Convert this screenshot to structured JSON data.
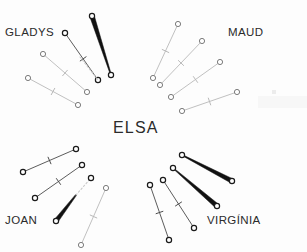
{
  "figure": {
    "type": "radial-segment-diagram",
    "background_color": "#fdfdfd",
    "width": 307,
    "height": 252
  },
  "labels": {
    "center": {
      "text": "ELSA",
      "x": 113,
      "y": 119
    },
    "top_left": {
      "text": "GLADYS",
      "x": 5,
      "y": 26
    },
    "top_right": {
      "text": "MAUD",
      "x": 228,
      "y": 26
    },
    "bottom_left": {
      "text": "JOAN",
      "x": 5,
      "y": 214
    },
    "bottom_right": {
      "text": "VIRGÍNIA",
      "x": 207,
      "y": 214
    }
  },
  "colors": {
    "thin_light": "#b9b9b9",
    "thin_dark": "#4a4a4a",
    "thick_black": "#111111",
    "dashed": "#c9c9c9",
    "marker_stroke": "#6d6d6d",
    "marker_stroke_dark": "#1a1a1a",
    "text": "#2b2b2b"
  },
  "groups": [
    {
      "name": "gladys-group",
      "label": "GLADYS",
      "segments": [
        {
          "id": "gladys-seg-1",
          "style": "thick-taper",
          "x1": 92,
          "y1": 16,
          "x2": 111,
          "y2": 75,
          "w1": 4.6,
          "w2": 0.9,
          "tick": false,
          "markers": [
            "start-dark",
            "end-dark"
          ]
        },
        {
          "id": "gladys-seg-2",
          "style": "thin-dark",
          "x1": 65,
          "y1": 33,
          "x2": 98,
          "y2": 80,
          "w1": 0.9,
          "w2": 0.9,
          "tick": true,
          "tick_pos": 0.55,
          "markers": [
            "start-dark",
            "end-dark"
          ]
        },
        {
          "id": "gladys-seg-3",
          "style": "dashed",
          "x1": 80,
          "y1": 57,
          "x2": 98,
          "y2": 80,
          "w1": 0.9,
          "w2": 0.9,
          "tick": false,
          "markers": []
        },
        {
          "id": "gladys-seg-4",
          "style": "thin-light",
          "x1": 43,
          "y1": 54,
          "x2": 87,
          "y2": 92,
          "w1": 0.9,
          "w2": 0.9,
          "tick": true,
          "tick_pos": 0.5,
          "markers": [
            "start-light",
            "end-light"
          ]
        },
        {
          "id": "gladys-seg-5",
          "style": "thin-light",
          "x1": 28,
          "y1": 78,
          "x2": 78,
          "y2": 105,
          "w1": 0.9,
          "w2": 0.9,
          "tick": true,
          "tick_pos": 0.5,
          "markers": [
            "start-light",
            "end-light"
          ]
        }
      ]
    },
    {
      "name": "maud-group",
      "label": "MAUD",
      "segments": [
        {
          "id": "maud-seg-1",
          "style": "thin-light",
          "x1": 153,
          "y1": 78,
          "x2": 178,
          "y2": 24,
          "w1": 0.9,
          "w2": 0.9,
          "tick": true,
          "tick_pos": 0.5,
          "markers": [
            "start-light",
            "end-light"
          ]
        },
        {
          "id": "maud-seg-2",
          "style": "thin-light",
          "x1": 160,
          "y1": 85,
          "x2": 202,
          "y2": 41,
          "w1": 0.9,
          "w2": 0.9,
          "tick": true,
          "tick_pos": 0.5,
          "markers": [
            "start-light",
            "end-light"
          ]
        },
        {
          "id": "maud-seg-3",
          "style": "thin-light",
          "x1": 171,
          "y1": 97,
          "x2": 220,
          "y2": 62,
          "w1": 0.9,
          "w2": 0.9,
          "tick": true,
          "tick_pos": 0.5,
          "markers": [
            "start-light",
            "end-light"
          ]
        },
        {
          "id": "maud-seg-4",
          "style": "thin-light",
          "x1": 182,
          "y1": 111,
          "x2": 237,
          "y2": 92,
          "w1": 0.9,
          "w2": 0.9,
          "tick": true,
          "tick_pos": 0.5,
          "markers": [
            "start-light",
            "end-light"
          ]
        }
      ]
    },
    {
      "name": "joan-group",
      "label": "JOAN",
      "segments": [
        {
          "id": "joan-seg-1",
          "style": "thin-dark",
          "x1": 23,
          "y1": 172,
          "x2": 76,
          "y2": 149,
          "w1": 0.9,
          "w2": 0.9,
          "tick": true,
          "tick_pos": 0.5,
          "markers": [
            "start-dark",
            "end-dark"
          ]
        },
        {
          "id": "joan-seg-2",
          "style": "thin-dark",
          "x1": 35,
          "y1": 198,
          "x2": 82,
          "y2": 165,
          "w1": 0.9,
          "w2": 0.9,
          "tick": true,
          "tick_pos": 0.5,
          "markers": [
            "start-dark",
            "end-dark"
          ]
        },
        {
          "id": "joan-seg-3",
          "style": "thick-taper",
          "x1": 56,
          "y1": 221,
          "x2": 76,
          "y2": 195,
          "w1": 4.4,
          "w2": 1.2,
          "tick": false,
          "markers": [
            "start-dark"
          ]
        },
        {
          "id": "joan-seg-4",
          "style": "dashed",
          "x1": 76,
          "y1": 195,
          "x2": 91,
          "y2": 178,
          "w1": 0.9,
          "w2": 0.9,
          "tick": false,
          "markers": [
            "end-dark"
          ]
        },
        {
          "id": "joan-seg-5",
          "style": "thin-light",
          "x1": 81,
          "y1": 245,
          "x2": 106,
          "y2": 188,
          "w1": 0.9,
          "w2": 0.9,
          "tick": true,
          "tick_pos": 0.5,
          "markers": [
            "start-light",
            "end-light"
          ]
        }
      ]
    },
    {
      "name": "virginia-group",
      "label": "VIRGÍNIA",
      "segments": [
        {
          "id": "virginia-seg-1",
          "style": "thick-taper",
          "x1": 182,
          "y1": 155,
          "x2": 232,
          "y2": 181,
          "w1": 0.9,
          "w2": 4.6,
          "tick": false,
          "markers": [
            "start-dark",
            "end-dark"
          ]
        },
        {
          "id": "virginia-seg-2",
          "style": "thick-taper",
          "x1": 173,
          "y1": 168,
          "x2": 217,
          "y2": 206,
          "w1": 0.9,
          "w2": 4.6,
          "tick": false,
          "markers": [
            "start-dark",
            "end-dark"
          ]
        },
        {
          "id": "virginia-seg-3",
          "style": "thin-dark",
          "x1": 163,
          "y1": 180,
          "x2": 194,
          "y2": 228,
          "w1": 0.9,
          "w2": 0.9,
          "tick": true,
          "tick_pos": 0.5,
          "markers": [
            "start-dark",
            "end-dark"
          ]
        },
        {
          "id": "virginia-seg-4",
          "style": "thin-dark",
          "x1": 150,
          "y1": 185,
          "x2": 169,
          "y2": 240,
          "w1": 0.9,
          "w2": 0.9,
          "tick": true,
          "tick_pos": 0.5,
          "markers": [
            "start-dark",
            "end-dark"
          ]
        }
      ]
    }
  ]
}
